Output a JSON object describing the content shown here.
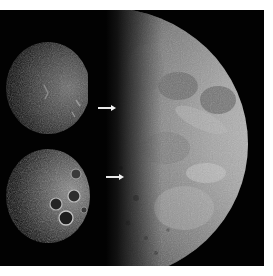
{
  "figure": {
    "background_color": "#020202",
    "page_color": "#ffffff",
    "panels": [
      {
        "id": "closeup-top",
        "label": "",
        "position": "left-top"
      },
      {
        "id": "closeup-bottom",
        "label": "",
        "position": "left-bottom"
      },
      {
        "id": "half-moon",
        "label": "",
        "position": "right"
      }
    ],
    "arrows": [
      {
        "id": "arrow-upper",
        "direction": "right",
        "color": "#e8e8e8"
      },
      {
        "id": "arrow-lower",
        "direction": "right",
        "color": "#e8e8e8"
      }
    ],
    "colors": {
      "moon_highlight": "#cfcfcf",
      "moon_mid": "#8a8a8a",
      "moon_shadow": "#2a2a2a",
      "mare": "#6e6e6e"
    }
  }
}
